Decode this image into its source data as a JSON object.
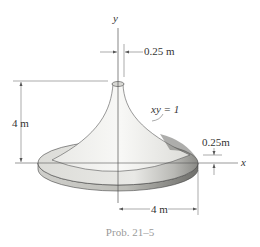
{
  "figure": {
    "axis_y_label": "y",
    "axis_x_label": "x",
    "top_radius_label": "0.25 m",
    "height_label": "4 m",
    "curve_label": "xy = 1",
    "thickness_label": "0.25m",
    "base_radius_label": "4 m",
    "caption": "Prob. 21–5"
  }
}
